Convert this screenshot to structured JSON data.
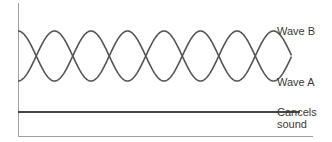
{
  "diagram": {
    "title": "",
    "labels": {
      "wave_b": "Wave B",
      "wave_a": "Wave A",
      "cancel_line1": "Cancels",
      "cancel_line2": "sound"
    },
    "colors": {
      "wave": "#555555",
      "cancel_line": "#444444",
      "axis": "#9a9a9a"
    },
    "waves": [
      {
        "name": "Wave A",
        "phase": "starts at trough",
        "half_periods": 7.5
      },
      {
        "name": "Wave B",
        "phase": "starts at crest (180° out of phase with A)",
        "half_periods": 7.5
      }
    ],
    "result": {
      "name": "Cancels sound",
      "shape": "flat line"
    }
  }
}
